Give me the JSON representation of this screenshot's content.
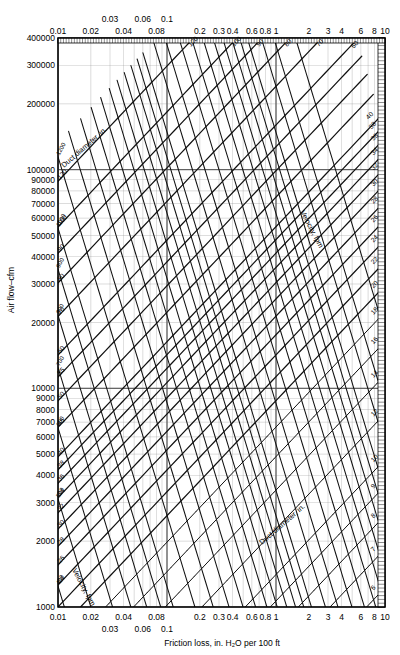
{
  "chart_data": {
    "type": "line",
    "title": "",
    "xlabel": "Friction loss, in. H₂O per 100 ft",
    "ylabel": "Air flow–cfm",
    "xscale": "log",
    "yscale": "log",
    "xlim": [
      0.01,
      10
    ],
    "ylim": [
      1000,
      400000
    ],
    "grid": true,
    "legend": "none",
    "x_ticks_bottom_upper": [
      "0.01",
      "0.02",
      "0.04",
      "0.08",
      "0.2",
      "0.3",
      "0.4",
      "0.6",
      "0.8",
      "1",
      "2",
      "3",
      "4",
      "6",
      "8",
      "10"
    ],
    "x_ticks_bottom_lower": [
      "0.03",
      "0.06",
      "0.1"
    ],
    "x_ticks_top_upper": [
      "0.03",
      "0.06",
      "0.1"
    ],
    "x_ticks_top_lower": [
      "0.01",
      "0.02",
      "0.04",
      "0.08",
      "0.2",
      "0.3",
      "0.4",
      "0.6",
      "0.8",
      "1",
      "2",
      "3",
      "4",
      "6",
      "8",
      "10"
    ],
    "y_ticks": [
      "1000",
      "2000",
      "3000",
      "4000",
      "5000",
      "6000",
      "7000",
      "8000",
      "9000",
      "10000",
      "20000",
      "30000",
      "40000",
      "50000",
      "60000",
      "70000",
      "80000",
      "90000",
      "100000",
      "200000",
      "300000",
      "400000"
    ],
    "families": [
      {
        "name": "duct-diameter",
        "label": "Duct diameter, in.",
        "unit": "in.",
        "values": [
          4,
          5,
          6,
          7,
          8,
          9,
          10,
          12,
          14,
          16,
          18,
          20,
          22,
          24,
          26,
          28,
          30,
          32,
          34,
          36,
          38,
          40,
          45,
          50,
          55,
          60,
          70,
          80,
          90,
          100,
          120
        ]
      },
      {
        "name": "velocity",
        "label": "Velocity, fpm",
        "unit": "fpm",
        "values": [
          300,
          400,
          500,
          600,
          700,
          800,
          900,
          1000,
          1200,
          1400,
          1600,
          1800,
          2000,
          2200,
          2400,
          2600,
          2800,
          3000,
          3200,
          3600,
          4000,
          4500,
          5000,
          5500,
          6000,
          6500,
          7000,
          7500,
          8000,
          9000,
          10000,
          12000
        ]
      }
    ],
    "annotations": [
      {
        "text": "Duct diameter, in.",
        "position": "upper-left"
      },
      {
        "text": "Duct diameter, in.",
        "position": "lower-right"
      },
      {
        "text": "Velocity, fpm",
        "position": "upper-right"
      },
      {
        "text": "Velocity, fpm",
        "position": "lower-left"
      }
    ]
  },
  "axes": {
    "x_caption": "Friction loss, in. H₂O per 100 ft",
    "y_caption": "Air flow–cfm"
  },
  "labels": {
    "duct_family": "Duct diameter, in.",
    "velocity_family": "Velocity, fpm"
  }
}
